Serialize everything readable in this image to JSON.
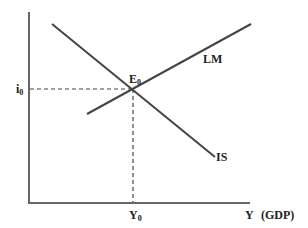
{
  "diagram": {
    "type": "IS-LM model",
    "colors": {
      "axis": "#666666",
      "curve": "#444444",
      "dashed": "#444444",
      "text": "#222222",
      "background": "#ffffff"
    },
    "axes": {
      "x_label": "Y",
      "x_label_suffix": "(GDP)",
      "y_label": ""
    },
    "curves": [
      {
        "name": "IS",
        "label": "IS",
        "slope": "downward"
      },
      {
        "name": "LM",
        "label": "LM",
        "slope": "upward"
      }
    ],
    "equilibrium": {
      "point_label": "E",
      "point_sub": "0",
      "interest_label": "i",
      "interest_sub": "0",
      "output_label": "Y",
      "output_sub": "0"
    }
  }
}
